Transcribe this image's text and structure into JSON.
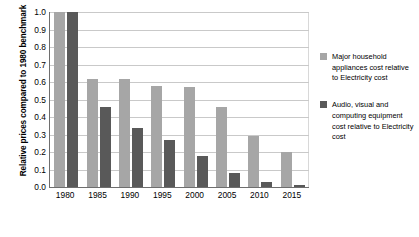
{
  "chart_data": {
    "type": "bar",
    "title": "",
    "xlabel": "",
    "ylabel": "Relative prices compared to 1980 benchmark",
    "ylim": [
      0.0,
      1.0
    ],
    "grid": true,
    "legend_position": "right",
    "categories": [
      "1980",
      "1985",
      "1990",
      "1995",
      "2000",
      "2005",
      "2010",
      "2015"
    ],
    "ytick_labels": [
      "1.0",
      "0.9",
      "0.8",
      "0.7",
      "0.6",
      "0.5",
      "0.4",
      "0.3",
      "0.2",
      "0.1",
      "0.0"
    ],
    "ytick_values": [
      1.0,
      0.9,
      0.8,
      0.7,
      0.6,
      0.5,
      0.4,
      0.3,
      0.2,
      0.1,
      0.0
    ],
    "series": [
      {
        "name": "Major household appliances cost relative to Electricity cost",
        "color": "#a6a6a6",
        "values": [
          1.0,
          0.62,
          0.62,
          0.58,
          0.57,
          0.46,
          0.29,
          0.2
        ]
      },
      {
        "name": "Audio, visual and computing equipment cost relative to Electricity cost",
        "color": "#595959",
        "values": [
          1.0,
          0.46,
          0.34,
          0.27,
          0.18,
          0.08,
          0.03,
          0.01
        ]
      }
    ]
  },
  "legend": {
    "entries": [
      {
        "label": "Major household appliances cost relative to Electricity cost"
      },
      {
        "label": "Audio, visual and computing equipment cost relative to Electricity cost"
      }
    ]
  }
}
